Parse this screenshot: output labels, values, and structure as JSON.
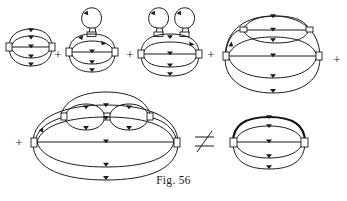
{
  "figure": {
    "caption": "Fig. 56",
    "ink_color": "#1b1b1b",
    "background_color": "#ffffff",
    "operators": {
      "plus": "+",
      "not_equal": "≠"
    },
    "rows": [
      {
        "name": "top-row",
        "terms": [
          {
            "id": "diagram-1",
            "label": "bare two-vertex triple-propagator loop",
            "loops_on_top": 0,
            "internal_bubble": false,
            "bold_top_arc": false
          },
          {
            "id": "diagram-2",
            "label": "two-vertex loop with one tadpole",
            "loops_on_top": 1,
            "internal_bubble": false,
            "bold_top_arc": false
          },
          {
            "id": "diagram-3",
            "label": "two-vertex loop with two tadpoles",
            "loops_on_top": 2,
            "internal_bubble": false,
            "bold_top_arc": false
          },
          {
            "id": "diagram-4",
            "label": "two-vertex loop with internal bubble insertion",
            "loops_on_top": 0,
            "internal_bubble": true,
            "bold_top_arc": false
          }
        ],
        "trailing_operator": "+"
      },
      {
        "name": "bottom-row",
        "leading_operator": "+",
        "terms": [
          {
            "id": "diagram-5",
            "label": "large loop with double-bubble insertion",
            "loops_on_top": 0,
            "internal_bubble": true,
            "bold_top_arc": false
          }
        ],
        "comparison_operator": "≠",
        "right_term": {
          "id": "diagram-6",
          "label": "dressed two-vertex loop with bold propagator",
          "loops_on_top": 0,
          "internal_bubble": false,
          "bold_top_arc": true
        }
      }
    ],
    "operator_positions": [
      {
        "name": "plus-1",
        "symbol": "+",
        "x": 58,
        "y": 54
      },
      {
        "name": "plus-2",
        "symbol": "+",
        "x": 130,
        "y": 54
      },
      {
        "name": "plus-3",
        "symbol": "+",
        "x": 211,
        "y": 54
      },
      {
        "name": "plus-4",
        "symbol": "+",
        "x": 333,
        "y": 60
      },
      {
        "name": "plus-5",
        "symbol": "+",
        "x": 19,
        "y": 143
      },
      {
        "name": "neq-1",
        "symbol": "≠",
        "x": 205,
        "y": 143
      }
    ]
  }
}
